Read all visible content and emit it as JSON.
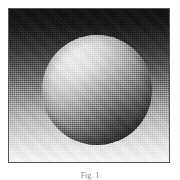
{
  "figure": {
    "kind": "raster-illustration",
    "frame": {
      "border_color": "#555555",
      "border_width_px": 1,
      "x": 8,
      "y": 8,
      "width": 162,
      "height": 155
    },
    "background": {
      "name": "vertical-gradient-backdrop",
      "direction": "top-to-bottom",
      "top_color": "#0d0d0d",
      "bottom_color": "#fbfbfb"
    },
    "sphere": {
      "name": "shaded-sphere",
      "center_x": 88,
      "center_y": 81,
      "radius": 55,
      "highlight_x": 75,
      "highlight_y": 62,
      "highlight_color": "#ffffff",
      "terminator_color": "#111111",
      "light_direction": "upper-left"
    },
    "rendering": {
      "name": "ordered-dither-overlay",
      "pattern": "checkerboard halftone",
      "cell_px": 2
    }
  },
  "caption": {
    "text": "Fig. 1",
    "visible": "partially clipped at bottom edge",
    "color": "#8a8a8a"
  }
}
